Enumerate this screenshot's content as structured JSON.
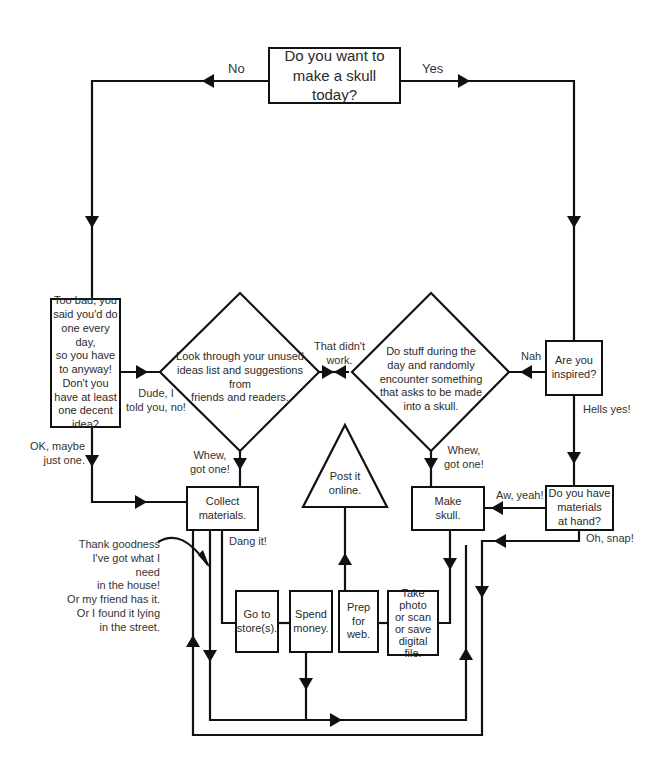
{
  "start": {
    "question": "Do you want to make a skull today?",
    "line1": "Do you want to",
    "line2": "make a skull today?"
  },
  "branches": {
    "no": "No",
    "yes": "Yes"
  },
  "nodes": {
    "too_bad": [
      "Too bad, you",
      "said you'd do",
      "one every day,",
      "so you have",
      "to anyway!",
      "Don't you",
      "have at least",
      "one decent",
      "idea?"
    ],
    "look_through": [
      "Look through your unused",
      "ideas list and suggestions from",
      "friends and readers."
    ],
    "do_stuff": [
      "Do stuff during the",
      "day and randomly",
      "encounter something",
      "that asks to be made",
      "into a skull."
    ],
    "inspired": [
      "Are you",
      "inspired?"
    ],
    "materials_at_hand": [
      "Do you have",
      "materials",
      "at hand?"
    ],
    "collect": [
      "Collect",
      "materials."
    ],
    "make_skull": [
      "Make",
      "skull."
    ],
    "post_online": [
      "Post it",
      "online."
    ],
    "go_store": [
      "Go to",
      "store(s)."
    ],
    "spend_money": [
      "Spend",
      "money."
    ],
    "prep_web": [
      "Prep",
      "for",
      "web."
    ],
    "take_photo": [
      "Take",
      "photo",
      "or scan",
      "or save",
      "digital file."
    ]
  },
  "labels": {
    "dude": [
      "Dude, I",
      "told you, no!"
    ],
    "didnt_work": [
      "That didn't",
      "work."
    ],
    "nah": "Nah",
    "hells_yes": "Hells yes!",
    "ok_maybe": [
      "OK, maybe",
      "just one."
    ],
    "whew_left": [
      "Whew,",
      "got one!"
    ],
    "whew_right": [
      "Whew,",
      "got one!"
    ],
    "aw_yeah": "Aw, yeah!",
    "oh_snap": "Oh, snap!",
    "dang_it": "Dang it!",
    "thank_goodness": [
      "Thank goodness",
      "I've got what I need",
      "in the house!",
      "Or my friend has it.",
      "Or I found it lying",
      "in the street."
    ]
  },
  "colors": {
    "line": "#111111",
    "text": "#2a2a2a",
    "background": "#ffffff"
  }
}
